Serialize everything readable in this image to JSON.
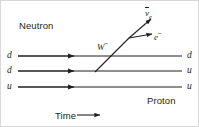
{
  "figure": {
    "background_color": "#ffffff",
    "line_color": "#231f20",
    "border_color": "#d8d8d8"
  },
  "labels": {
    "neutron": "Neutron",
    "proton": "Proton",
    "time_axis": "Time",
    "time_arrow_icon": "right-arrow-icon"
  },
  "particles": {
    "w_boson": {
      "symbol": "W",
      "charge": "−"
    },
    "antineutrino": {
      "symbol": "ν",
      "bar": true,
      "subscript": "e"
    },
    "electron": {
      "symbol": "e",
      "charge": "−"
    }
  },
  "quark_lines": [
    {
      "incoming": "d",
      "outgoing": "d",
      "y": 55,
      "arrow_x": 72
    },
    {
      "incoming": "d",
      "outgoing": "u",
      "y": 70,
      "arrow_x": 72
    },
    {
      "incoming": "u",
      "outgoing": "u",
      "y": 86,
      "arrow_x": 72
    }
  ],
  "vertex": {
    "x": 95,
    "y": 70
  },
  "branch_point": {
    "x": 128,
    "y": 37
  }
}
